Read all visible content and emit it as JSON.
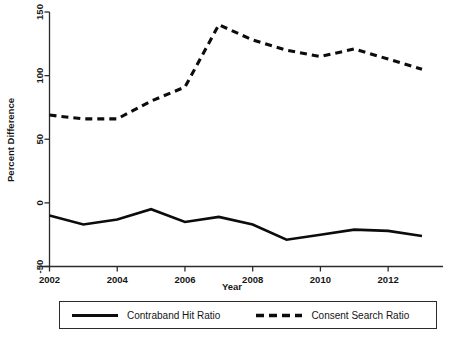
{
  "chart_data": {
    "type": "line",
    "title": "",
    "xlabel": "Year",
    "ylabel": "Percent Difference",
    "x": [
      2002,
      2003,
      2004,
      2005,
      2006,
      2007,
      2008,
      2009,
      2010,
      2011,
      2012,
      2013
    ],
    "xlim": [
      2002,
      2013
    ],
    "ylim": [
      -50,
      150
    ],
    "xticks": [
      2002,
      2004,
      2006,
      2008,
      2010,
      2012
    ],
    "xticklabels": [
      "2002",
      "2004",
      "2006",
      "2008",
      "2010",
      "2012"
    ],
    "yticks": [
      -50,
      0,
      50,
      100,
      150
    ],
    "yticklabels": [
      "-50",
      "0",
      "50",
      "100",
      "150"
    ],
    "grid": false,
    "legend_position": "below-axes",
    "series": [
      {
        "name": "Contraband Hit Ratio",
        "style": "solid",
        "color": "#0c0c0c",
        "values": [
          -10,
          -17,
          -13,
          -5,
          -15,
          -11,
          -17,
          -29,
          -25,
          -21,
          -22,
          -26
        ]
      },
      {
        "name": "Consent Search Ratio",
        "style": "dashed",
        "color": "#0c0c0c",
        "values": [
          69,
          66,
          66,
          80,
          91,
          140,
          128,
          120,
          115,
          121,
          113,
          105
        ]
      }
    ]
  },
  "legend": {
    "entries": [
      {
        "label": "Contraband Hit Ratio",
        "style": "solid"
      },
      {
        "label": "Consent Search Ratio",
        "style": "dashed"
      }
    ]
  }
}
